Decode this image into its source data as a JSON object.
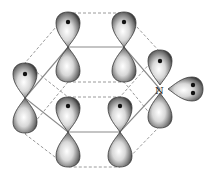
{
  "diagram": {
    "heteroatom_label": "N",
    "colors": {
      "background": "#ffffff",
      "bond_line": "#8a8a8a",
      "dashed_line": "#9a9a9a",
      "lobe_edge": "#3a3a3a",
      "lobe_highlight": "#ffffff",
      "electron_dot": "#111111"
    },
    "ring_atoms": [
      {
        "id": "c-top-left",
        "x": 68,
        "y": 47
      },
      {
        "id": "c-top-right",
        "x": 124,
        "y": 47
      },
      {
        "id": "n",
        "x": 160,
        "y": 89
      },
      {
        "id": "c-bottom-right",
        "x": 120,
        "y": 132
      },
      {
        "id": "c-bottom-left",
        "x": 68,
        "y": 132
      },
      {
        "id": "c-left",
        "x": 25,
        "y": 98
      }
    ],
    "p_orbitals": [
      {
        "atom": "c-top-left",
        "electrons": 1
      },
      {
        "atom": "c-top-right",
        "electrons": 1
      },
      {
        "atom": "n",
        "electrons": 1
      },
      {
        "atom": "c-bottom-right",
        "electrons": 1
      },
      {
        "atom": "c-bottom-left",
        "electrons": 1
      },
      {
        "atom": "c-left",
        "electrons": 1
      }
    ],
    "lone_pair": {
      "atom": "n",
      "electrons": 2,
      "direction": "in-plane, right"
    }
  }
}
